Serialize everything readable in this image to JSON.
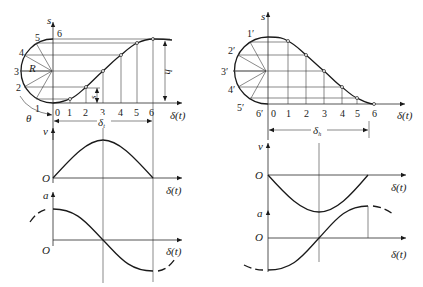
{
  "figure": {
    "left_panel": {
      "s_axis_label": "s",
      "x_axis_label": "δ(t)",
      "circle_point_labels": [
        "1",
        "2",
        "3",
        "4",
        "5",
        "6"
      ],
      "radius_label": "R",
      "angle_label": "θ",
      "tick_labels": [
        "0",
        "1",
        "2",
        "3",
        "4",
        "5",
        "6"
      ],
      "displacement_label": "s",
      "height_label": "h",
      "interval_label": "δ",
      "interval_subscript": "t",
      "velocity_axis_label": "v",
      "velocity_origin_label": "O",
      "velocity_x_label": "δ(t)",
      "accel_axis_label": "a",
      "accel_origin_label": "O",
      "accel_x_label": "δ(t)"
    },
    "right_panel": {
      "s_axis_label": "s",
      "x_axis_label": "δ(t)",
      "circle_point_labels": [
        "1′",
        "2′",
        "3′",
        "4′",
        "5′",
        "6′"
      ],
      "tick_labels": [
        "0",
        "1",
        "2",
        "3",
        "4",
        "5",
        "6"
      ],
      "interval_label": "δ",
      "interval_subscript": "h",
      "velocity_axis_label": "v",
      "velocity_origin_label": "O",
      "velocity_x_label": "δ(t)",
      "accel_axis_label": "a",
      "accel_origin_label": "O",
      "accel_x_label": "δ(t)"
    }
  }
}
